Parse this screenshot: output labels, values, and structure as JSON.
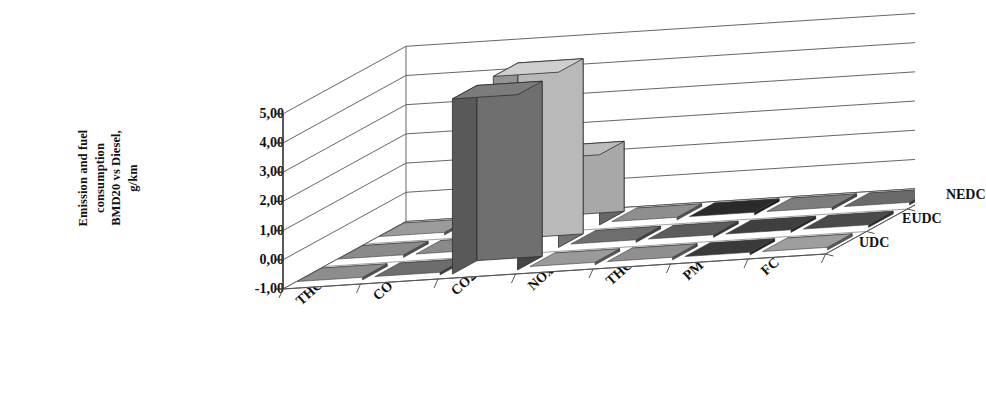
{
  "chart_data": {
    "type": "bar",
    "subtype": "3d-grouped-bar",
    "title": "",
    "xlabel": "",
    "ylabel": "Emission and fuel consumption BMD20 vs Diesel, g/km",
    "ylabel_lines": [
      "Emission and fuel",
      "consumption",
      "BMD20 vs Diesel,",
      "g/km"
    ],
    "categories": [
      "THC",
      "CO",
      "CO2",
      "NOx",
      "THC+NOx",
      "PM",
      "FC"
    ],
    "series_axis_labels": [
      "NEDC",
      "EUDC",
      "UDC"
    ],
    "ylim": [
      -1.0,
      5.0
    ],
    "ytick_labels": [
      "5,00",
      "4,00",
      "3,00",
      "2,00",
      "1,00",
      "0,00",
      "-1,00"
    ],
    "ytick_values": [
      5.0,
      4.0,
      3.0,
      2.0,
      1.0,
      0.0,
      -1.0
    ],
    "grid": true,
    "decimal_separator": ",",
    "legend_position": "right-axis",
    "series": [
      {
        "name": "NEDC",
        "color": "#6f6f6f",
        "values": [
          0.05,
          0.05,
          5.0,
          0.05,
          0.05,
          0.05,
          0.05
        ]
      },
      {
        "name": "EUDC",
        "color": "#b9b9b9",
        "values": [
          0.05,
          0.05,
          5.0,
          0.05,
          0.05,
          0.05,
          0.05
        ]
      },
      {
        "name": "UDC",
        "color": "#a8a8a8",
        "values": [
          0.05,
          0.05,
          1.4,
          0.05,
          0.05,
          0.05,
          0.05
        ]
      }
    ],
    "tile_shades": {
      "NEDC": [
        "#8d8d8d",
        "#6d6d6d",
        "#7a7a7a",
        "#9a9a9a",
        "#8f8f8f",
        "#3a3a3a",
        "#9e9e9e"
      ],
      "EUDC": [
        "#8a8a8a",
        "#8a8a8a",
        "#2b2b2b",
        "#6e6e6e",
        "#5c5c5c",
        "#3f3f3f",
        "#4a4a4a"
      ],
      "UDC": [
        "#9b9b9b",
        "#9b9b9b",
        "#1e1e1e",
        "#8e8e8e",
        "#2a2a2a",
        "#7d7d7d",
        "#6a6a6a"
      ]
    }
  }
}
